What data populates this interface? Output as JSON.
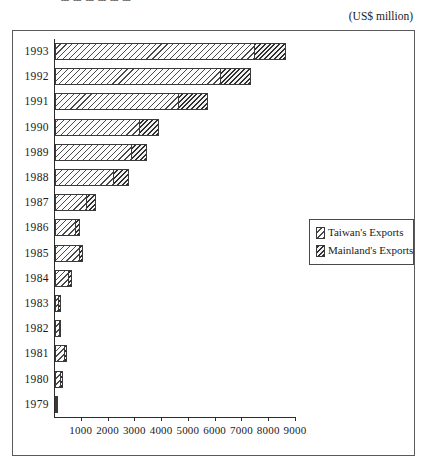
{
  "title_partial": "ɯ ɯ ɯ ɯ ɯ ɯ",
  "unit_caption": "(US$ million)",
  "legend": {
    "entries": [
      {
        "label": "Taiwan's Exports",
        "pattern": "light-diagonal-hatch"
      },
      {
        "label": "Mainland's Exports",
        "pattern": "dark-diagonal-hatch"
      }
    ]
  },
  "chart_data": {
    "type": "bar",
    "orientation": "horizontal",
    "stacked": true,
    "title": "",
    "xlabel": "",
    "ylabel": "",
    "unit": "US$ million",
    "xlim": [
      0,
      9000
    ],
    "xticks": [
      1000,
      2000,
      3000,
      4000,
      5000,
      6000,
      7000,
      8000,
      9000
    ],
    "xtick_labels": [
      "1000",
      "2000",
      "3000",
      "4000",
      "5000",
      "6000",
      "7000",
      "8000",
      "9000"
    ],
    "grid": false,
    "legend_position": "middle-right",
    "categories": [
      "1993",
      "1992",
      "1991",
      "1990",
      "1989",
      "1988",
      "1987",
      "1986",
      "1985",
      "1984",
      "1983",
      "1982",
      "1981",
      "1980",
      "1979"
    ],
    "series": [
      {
        "name": "Taiwan's Exports",
        "values": [
          7460,
          6200,
          4630,
          3170,
          2870,
          2200,
          1190,
          780,
          930,
          520,
          160,
          190,
          390,
          240,
          20
        ]
      },
      {
        "name": "Mainland's Exports",
        "values": [
          1200,
          1150,
          1120,
          750,
          600,
          600,
          390,
          180,
          150,
          150,
          90,
          90,
          80,
          80,
          50
        ]
      }
    ],
    "totals": [
      8660,
      7350,
      5750,
      3920,
      3470,
      2800,
      1580,
      960,
      1080,
      670,
      250,
      280,
      470,
      320,
      70
    ]
  }
}
